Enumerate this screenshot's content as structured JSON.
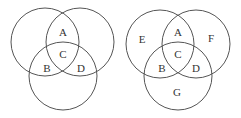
{
  "diagrams": [
    {
      "name": "left-venn",
      "circles": [
        {
          "cx": 45,
          "cy": 42,
          "r": 34
        },
        {
          "cx": 80,
          "cy": 42,
          "r": 34
        },
        {
          "cx": 63,
          "cy": 76,
          "r": 34
        }
      ],
      "labels": [
        {
          "text": "A",
          "x": 63,
          "y": 32
        },
        {
          "text": "C",
          "x": 63,
          "y": 54
        },
        {
          "text": "B",
          "x": 47,
          "y": 68
        },
        {
          "text": "D",
          "x": 81,
          "y": 68
        }
      ]
    },
    {
      "name": "right-venn",
      "circles": [
        {
          "cx": 160,
          "cy": 44,
          "r": 34
        },
        {
          "cx": 196,
          "cy": 44,
          "r": 34
        },
        {
          "cx": 178,
          "cy": 76,
          "r": 34
        }
      ],
      "labels": [
        {
          "text": "E",
          "x": 142,
          "y": 39
        },
        {
          "text": "A",
          "x": 178,
          "y": 32
        },
        {
          "text": "F",
          "x": 211,
          "y": 38
        },
        {
          "text": "C",
          "x": 178,
          "y": 54
        },
        {
          "text": "B",
          "x": 162,
          "y": 68
        },
        {
          "text": "D",
          "x": 196,
          "y": 68
        },
        {
          "text": "G",
          "x": 177,
          "y": 92
        }
      ]
    }
  ],
  "colors": {
    "stroke": "#555555",
    "text": "#333333",
    "background": "#ffffff"
  }
}
